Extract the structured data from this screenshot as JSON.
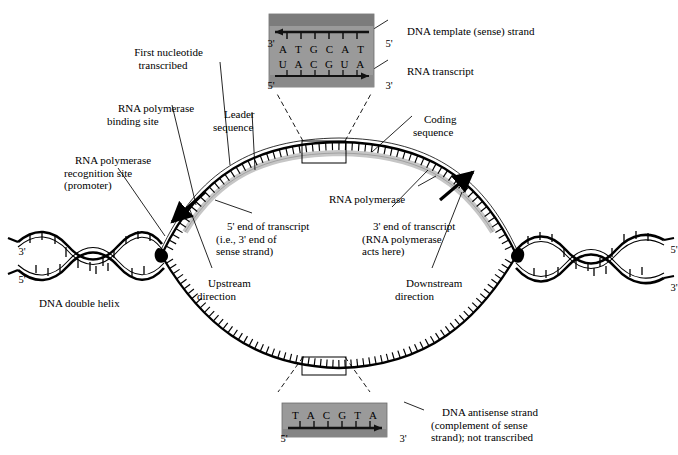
{
  "diagram": {
    "labels": {
      "first_nucleotide": "First nucleotide\ntranscribed",
      "rna_pol_binding": "RNA polymerase\nbinding site",
      "rna_pol_recognition": "RNA polymerase\nrecognition site\n(promoter)",
      "leader_sequence": "Leader\nsequence",
      "coding_sequence": "Coding\nsequence",
      "rna_polymerase": "RNA polymerase",
      "five_prime_end": "5' end of transcript\n(i.e., 3' end of\nsense strand)",
      "three_prime_end": "3' end of transcript\n(RNA polymerase\nacts here)",
      "upstream": "Upstream\ndirection",
      "downstream": "Downstream\ndirection",
      "dna_double_helix": "DNA double helix",
      "dna_template_strand": "DNA template (sense) strand",
      "rna_transcript": "RNA transcript",
      "dna_antisense": "DNA antisense strand\n(complement of sense\nstrand); not transcribed"
    },
    "helix_left": {
      "top_end": "3'",
      "bottom_end": "5'"
    },
    "helix_right": {
      "top_end": "5'",
      "bottom_end": "3'"
    },
    "inset_top": {
      "left_top": "3'",
      "right_top": "5'",
      "left_bottom": "5'",
      "right_bottom": "3'",
      "dna_bases": [
        "A",
        "T",
        "G",
        "C",
        "A",
        "T"
      ],
      "rna_bases": [
        "U",
        "A",
        "C",
        "G",
        "U",
        "A"
      ]
    },
    "inset_bottom": {
      "left_end": "5'",
      "right_end": "3'",
      "bases": [
        "T",
        "A",
        "C",
        "G",
        "T",
        "A"
      ]
    },
    "colors": {
      "ink": "#000000",
      "inset_fill": "#9a9a9a",
      "inset_band": "#767676",
      "rna_strand": "#c9c9c9",
      "background": "#ffffff"
    }
  }
}
